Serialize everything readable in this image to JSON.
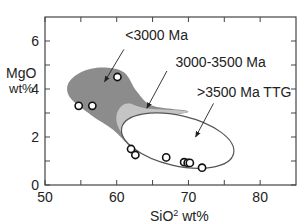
{
  "chart_data": {
    "type": "scatter",
    "title": "",
    "xlabel": "SiO",
    "xlabel_sup": "2",
    "xlabel_unit": " wt%",
    "ylabel_line1": "MgO",
    "ylabel_line2": "wt%",
    "xlim": [
      50,
      85
    ],
    "ylim": [
      0,
      7
    ],
    "xticks": [
      50,
      60,
      70,
      80
    ],
    "xticks_minor": [
      55,
      65,
      75
    ],
    "yticks": [
      0,
      2,
      4,
      6
    ],
    "yticks_minor": [
      1,
      3,
      5
    ],
    "grid": false,
    "points": [
      {
        "x": 60.1,
        "y": 4.5
      },
      {
        "x": 54.7,
        "y": 3.3
      },
      {
        "x": 56.6,
        "y": 3.3
      },
      {
        "x": 62.0,
        "y": 1.5
      },
      {
        "x": 62.6,
        "y": 1.25
      },
      {
        "x": 66.9,
        "y": 1.15
      },
      {
        "x": 69.4,
        "y": 0.95
      },
      {
        "x": 69.9,
        "y": 0.92
      },
      {
        "x": 70.2,
        "y": 0.92
      },
      {
        "x": 71.9,
        "y": 0.72
      }
    ],
    "fields": [
      {
        "name": "<3000 Ma",
        "fill": "#8c8c8c",
        "outline": [
          [
            53.2,
            4.2
          ],
          [
            55.0,
            4.7
          ],
          [
            58.0,
            4.9
          ],
          [
            61.0,
            4.7
          ],
          [
            62.8,
            3.9
          ],
          [
            65.0,
            3.3
          ],
          [
            70.0,
            3.05
          ],
          [
            64.0,
            2.7
          ],
          [
            62.2,
            2.1
          ],
          [
            62.3,
            1.5
          ],
          [
            59.5,
            2.3
          ],
          [
            56.5,
            2.9
          ],
          [
            53.6,
            3.6
          ]
        ]
      },
      {
        "name": "3000-3500 Ma",
        "fill": "#c4c4c4",
        "outline": [
          [
            60.2,
            3.1
          ],
          [
            61.5,
            3.4
          ],
          [
            64.0,
            3.2
          ],
          [
            70.0,
            3.05
          ],
          [
            64.0,
            2.75
          ],
          [
            62.5,
            2.2
          ],
          [
            62.4,
            1.6
          ],
          [
            61.0,
            2.0
          ],
          [
            60.0,
            2.6
          ]
        ]
      }
    ],
    "ellipse": {
      "name": ">3500 Ma TTG",
      "fill": "#ffffff",
      "center": [
        68.5,
        1.85
      ],
      "semi_major_data": 8.0,
      "semi_minor_data": 1.05,
      "angle_deg": -13
    },
    "annotations": [
      {
        "text": "<3000 Ma",
        "text_at": [
          61.2,
          6.05
        ],
        "arrow_from": [
          61.0,
          5.65
        ],
        "arrow_to": [
          58.3,
          4.3
        ]
      },
      {
        "text": "3000-3500 Ma",
        "text_at": [
          68.2,
          4.9
        ],
        "arrow_from": [
          67.0,
          4.75
        ],
        "arrow_to": [
          64.2,
          3.2
        ]
      },
      {
        "text": ">3500 Ma TTG",
        "text_at": [
          71.2,
          3.65
        ],
        "arrow_from": [
          73.5,
          3.4
        ],
        "arrow_to": [
          71.0,
          2.0
        ]
      }
    ]
  },
  "colors": {
    "axis": "#444444",
    "dark_field": "#8c8c8c",
    "light_field": "#c4c4c4",
    "marker_stroke": "#111111"
  }
}
